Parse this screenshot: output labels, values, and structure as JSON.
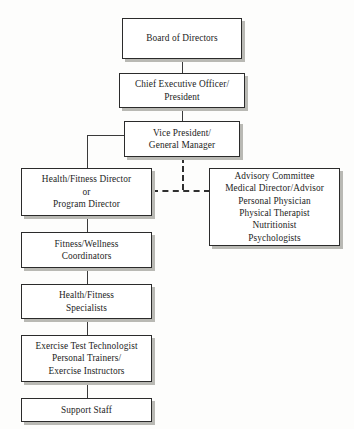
{
  "chart": {
    "type": "org-chart",
    "background_color": "#fdfdfc",
    "box_fill": "#ffffff",
    "box_border": "#2b2b2b",
    "shadow_color": "#b9b9b4",
    "connector_color": "#3a3a3a",
    "dashed_connector_color": "#2f2f2f"
  },
  "nodes": {
    "board": {
      "lines": [
        "Board of Directors"
      ]
    },
    "ceo": {
      "lines": [
        "Chief Executive Officer/",
        "President"
      ]
    },
    "vp": {
      "lines": [
        "Vice President/",
        "General Manager"
      ]
    },
    "director": {
      "lines": [
        "Health/Fitness Director",
        "or",
        "Program Director"
      ]
    },
    "advisory": {
      "lines": [
        "Advisory Committee",
        "Medical Director/Advisor",
        "Personal Physician",
        "Physical Therapist",
        "Nutritionist",
        "Psychologists"
      ]
    },
    "coordinators": {
      "lines": [
        "Fitness/Wellness",
        "Coordinators"
      ]
    },
    "specialists": {
      "lines": [
        "Health/Fitness",
        "Specialists"
      ]
    },
    "technologists": {
      "lines": [
        "Exercise Test Technologist",
        "Personal Trainers/",
        "Exercise Instructors"
      ]
    },
    "support": {
      "lines": [
        "Support Staff"
      ]
    }
  }
}
